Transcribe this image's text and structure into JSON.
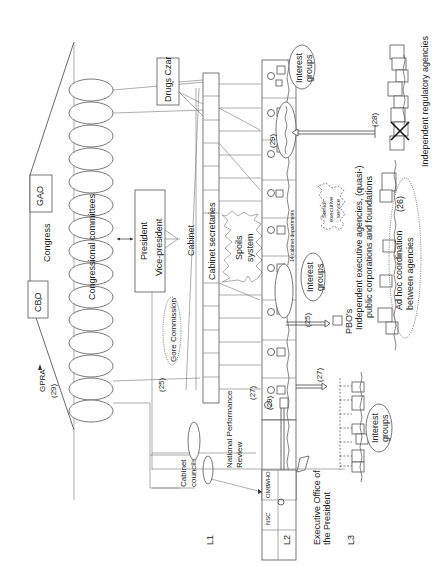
{
  "diagram": {
    "orientation": "rotated-90-ccw",
    "congress": {
      "label": "Congress",
      "cbo": "CBO",
      "gao": "GAO",
      "gpra": "GPRA",
      "gpra_ref": "(29)",
      "committees_label": "Congressional committees",
      "committee_count": 12
    },
    "executive": {
      "president": "President",
      "vice_president": "Vice-president",
      "gore_commission": "Gore Commission",
      "gore_ref": "(25)",
      "cabinet": "Cabinet",
      "cabinet_secretaries": "Cabinet secretaries",
      "drugs_czar": "Drugs Czar",
      "spoils_system_line1": "Spoils",
      "spoils_system_line2": "system",
      "cabinet_councils_line1": "Cabinet",
      "cabinet_councils_line2": "councils",
      "npr_line1": "National Performance",
      "npr_line2": "Review",
      "npr_ref": "(25)",
      "eop_line1": "Executive Office of",
      "eop_line2": "the President",
      "eop_units": [
        "NSC",
        "OMB",
        "WHO"
      ]
    },
    "departments": {
      "label": "14 cabinet departments",
      "refs": {
        "r29_top": "(29)",
        "r29_bottom": "(29)",
        "r25": "(25)",
        "r27_a": "(27)",
        "r27_b": "(27)",
        "r28": "(28)"
      },
      "pbos": "PBO's",
      "senior_exec_line1": "Senior",
      "senior_exec_line2": "executive",
      "senior_exec_line3": "service",
      "interest_groups": [
        "Interest groups",
        "Interest groups",
        "Interest groups"
      ]
    },
    "agencies": {
      "independent_exec_line1": "Independent executive agencies, (quasi-)",
      "independent_exec_line2": "public corporations and foundations",
      "adhoc_line1": "Ad hoc coordination",
      "adhoc_line2": "between agencies",
      "adhoc_ref": "(26)",
      "independent_regulatory": "Independent regulatory agencies"
    },
    "levels": [
      "L1",
      "L2",
      "L3"
    ],
    "interest_groups_label_line1": "Interest",
    "interest_groups_label_line2": "groups"
  }
}
